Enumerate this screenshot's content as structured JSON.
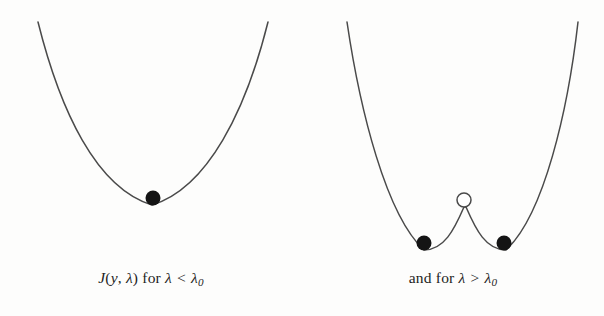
{
  "figure": {
    "background_color": "#fdfdfc",
    "curve_color": "#4a4a4a",
    "marker_fill_color": "#141414",
    "open_marker_fill_color": "#ffffff",
    "text_color": "#1d1d1d"
  },
  "panels": [
    {
      "id": "left",
      "caption": {
        "function_symbol": "J",
        "open_paren": "(",
        "arg_1": "y",
        "comma": ", ",
        "arg_2": "λ",
        "close_paren": ")",
        "connector": " for ",
        "lhs": "λ",
        "relation": " < ",
        "rhs_base": "λ",
        "rhs_sub": "0",
        "full_text": "J(y, λ) for λ < λ0"
      },
      "curve_path": "M 38 22 C 60 110, 96 188, 152 205 C 208 188, 246 110, 268 22",
      "markers": [
        {
          "type": "filled",
          "cx": 153,
          "cy": 198,
          "r": 7.5,
          "name": "stable-minimum-marker"
        }
      ]
    },
    {
      "id": "right",
      "caption": {
        "connector": "and for ",
        "lhs": "λ",
        "relation": " > ",
        "rhs_base": "λ",
        "rhs_sub": "0",
        "full_text": "and for λ > λ0"
      },
      "curve_path": "M 45 22 C 58 110, 84 215, 122 250 C 142 250, 152 230, 162 207 C 162 207, 163 207, 164 207 C 174 230, 184 250, 204 250 C 242 215, 266 110, 276 22",
      "markers": [
        {
          "type": "filled",
          "cx": 122,
          "cy": 243,
          "r": 7.5,
          "name": "left-well-minimum-marker"
        },
        {
          "type": "open",
          "cx": 162,
          "cy": 200,
          "r": 7.0,
          "name": "barrier-maximum-marker"
        },
        {
          "type": "filled",
          "cx": 202,
          "cy": 243,
          "r": 7.5,
          "name": "right-well-minimum-marker"
        }
      ]
    }
  ],
  "chart_data": {
    "type": "line",
    "title": "",
    "xlabel": "y",
    "ylabel": "J(y, λ)",
    "grid": false,
    "legend": "none",
    "annotations": [
      "J(y, λ) for λ < λ0",
      "and for λ > λ0"
    ],
    "series": [
      {
        "name": "J(y, λ) for λ < λ0",
        "shape": "single-well parabola",
        "critical_points": [
          {
            "kind": "minimum",
            "stability": "stable",
            "marker": "filled-circle",
            "x": 0.0,
            "y": 0.0
          }
        ]
      },
      {
        "name": "and for λ > λ0",
        "shape": "double-well with central barrier",
        "critical_points": [
          {
            "kind": "minimum",
            "stability": "stable",
            "marker": "filled-circle",
            "x": -1.0,
            "y": 0.0
          },
          {
            "kind": "maximum",
            "stability": "unstable",
            "marker": "open-circle",
            "x": 0.0,
            "y": 1.0
          },
          {
            "kind": "minimum",
            "stability": "stable",
            "marker": "filled-circle",
            "x": 1.0,
            "y": 0.0
          }
        ]
      }
    ]
  }
}
